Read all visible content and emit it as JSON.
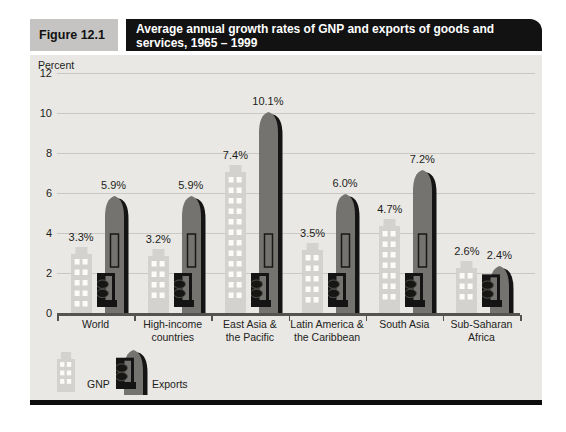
{
  "header": {
    "figure_label": "Figure 12.1",
    "title": "Average annual growth rates of GNP and exports of goods and services, 1965 – 1999",
    "title_lines": [
      "Average annual growth rates of GNP and exports of goods and",
      "services, 1965 – 1999"
    ]
  },
  "chart_data": {
    "type": "bar",
    "title": "Average annual growth rates of GNP and exports of goods and services, 1965 – 1999",
    "xlabel": "",
    "ylabel": "Percent",
    "ylim": [
      0,
      12
    ],
    "yticks": [
      0,
      2,
      4,
      6,
      8,
      10,
      12
    ],
    "grid": true,
    "legend_position": "bottom-left",
    "categories": [
      "World",
      "High-income countries",
      "East Asia & the Pacific",
      "Latin America & the Caribbean",
      "South Asia",
      "Sub-Saharan Africa"
    ],
    "category_lines": [
      [
        "World"
      ],
      [
        "High-income",
        "countries"
      ],
      [
        "East Asia &",
        "the Pacific"
      ],
      [
        "Latin America &",
        "the Caribbean"
      ],
      [
        "South Asia"
      ],
      [
        "Sub-Saharan",
        "Africa"
      ]
    ],
    "series": [
      {
        "name": "GNP",
        "icon": "building-icon",
        "values": [
          3.3,
          3.2,
          7.4,
          3.5,
          4.7,
          2.6
        ],
        "labels": [
          "3.3%",
          "3.2%",
          "7.4%",
          "3.5%",
          "4.7%",
          "2.6%"
        ]
      },
      {
        "name": "Exports",
        "icon": "ship-icon",
        "values": [
          5.9,
          5.9,
          10.1,
          6.0,
          7.2,
          2.4
        ],
        "labels": [
          "5.9%",
          "5.9%",
          "10.1%",
          "6.0%",
          "7.2%",
          "2.4%"
        ]
      }
    ]
  },
  "legend": {
    "gnp_label": "GNP",
    "exports_label": "Exports"
  },
  "colors": {
    "plot_bg": "#e9e8e4",
    "figure_label_bg": "#c5c4c2",
    "title_bar_bg": "#121212",
    "title_bar_text": "#ffffff",
    "building": "#d3d2ce",
    "building_window": "#fbfbf9",
    "export_body": "#757370",
    "export_shadow": "#141414",
    "gridline": "#c9c8c4",
    "axis": "#55534f",
    "text": "#1d1d1b",
    "bottom_rule": "#0d0d0d"
  }
}
